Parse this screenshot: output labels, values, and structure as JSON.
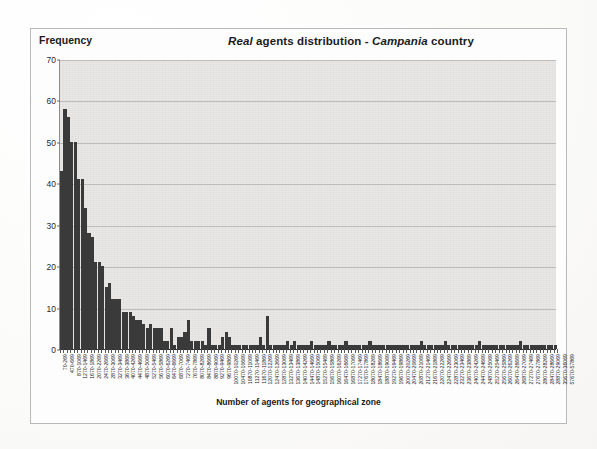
{
  "figure": {
    "title_parts": [
      {
        "text": "Real ",
        "italic": true
      },
      {
        "text": "agents distribution - ",
        "italic": false
      },
      {
        "text": "Campania",
        "italic": true
      },
      {
        "text": " country",
        "italic": false
      }
    ],
    "title_plain": "Real agents distribution - Campania country",
    "ylabel": "Frequency",
    "xlabel": "Number of agents for geographical zone"
  },
  "chart_data": {
    "type": "bar",
    "title": "Real agents distribution - Campania country",
    "xlabel": "Number of agents for geographical zone",
    "ylabel": "Frequency",
    "ylim": [
      0,
      70
    ],
    "ytick_values": [
      0,
      10,
      20,
      30,
      40,
      50,
      60,
      70
    ],
    "grid": true,
    "legend": "none",
    "bin_width": 200,
    "bar_color": "#3a3a3a",
    "plot_background": "#e9e8e6",
    "label_every_n_bins": 2,
    "categories": [
      "70-269",
      "270-469",
      "470-669",
      "670-869",
      "870-1069",
      "1070-1269",
      "1270-1469",
      "1470-1669",
      "1670-1869",
      "1870-2069",
      "2070-2269",
      "2270-2469",
      "2470-2669",
      "2670-2869",
      "2870-3069",
      "3070-3269",
      "3270-3469",
      "3470-3669",
      "3670-3869",
      "3870-4069",
      "4070-4269",
      "4270-4469",
      "4470-4669",
      "4670-4869",
      "4870-5069",
      "5070-5269",
      "5270-5469",
      "5470-5669",
      "5670-5869",
      "5870-6069",
      "6070-6269",
      "6270-6469",
      "6470-6669",
      "6670-6869",
      "6870-7069",
      "7070-7269",
      "7270-7469",
      "7470-7669",
      "7670-7869",
      "7870-8069",
      "8070-8269",
      "8270-8469",
      "8470-8669",
      "8670-8869",
      "8870-9069",
      "9070-9269",
      "9270-9469",
      "9470-9669",
      "9670-9869",
      "9870-10069",
      "10070-10269",
      "10270-10469",
      "10470-10669",
      "10670-10869",
      "10870-11069",
      "11070-11269",
      "11270-11469",
      "11470-11669",
      "11670-11869",
      "11870-12069",
      "12070-12269",
      "12270-12469",
      "12470-12669",
      "12670-12869",
      "12870-13069",
      "13070-13269",
      "13270-13469",
      "13470-13669",
      "13670-13869",
      "13870-14069",
      "14070-14269",
      "14270-14469",
      "14470-14669",
      "14670-14869",
      "14870-15069",
      "15070-15269",
      "15270-15469",
      "15470-15669",
      "15670-15869",
      "15870-16069",
      "16070-16269",
      "16270-16469",
      "16470-16669",
      "16670-16869",
      "16870-17069",
      "17070-17269",
      "17270-17469",
      "17470-17669",
      "17670-17869",
      "17870-18069",
      "18070-18269",
      "18270-18469",
      "18470-18669",
      "18670-18869",
      "18870-19069",
      "19070-19269",
      "19270-19469",
      "19470-19669",
      "19670-19869",
      "19870-20069",
      "20070-20269",
      "20270-20469",
      "20470-20669",
      "20670-20869",
      "20870-21069",
      "21070-21269",
      "21270-21469",
      "21470-21669",
      "21670-21869",
      "21870-22069",
      "22070-22269",
      "22270-22469",
      "22470-22669",
      "22670-22869",
      "22870-23069",
      "23070-23269",
      "23270-23469",
      "23470-23669",
      "23670-23869",
      "23870-24069",
      "24070-24269",
      "24270-24469",
      "24470-24669",
      "24670-24869",
      "24870-25069",
      "25070-25269",
      "25270-25469",
      "25470-25669",
      "25670-25869",
      "25870-26069",
      "26070-26269",
      "26270-26469",
      "26470-26669",
      "26670-26869",
      "26870-27069",
      "27070-27269",
      "27270-27469",
      "27470-27669",
      "27670-27869",
      "27870-28069",
      "28070-28269",
      "28270-28469",
      "28470-28669",
      "28670-28869",
      "28870-29069"
    ],
    "labeled_categories": [
      "70-269",
      "470-669",
      "870-1069",
      "1270-1469",
      "1670-1869",
      "2070-2269",
      "2470-2669",
      "2870-3069",
      "3270-3469",
      "3670-3869",
      "4070-4269",
      "4470-4669",
      "4870-5069",
      "5270-5469",
      "5670-5869",
      "6070-6269",
      "6470-6669",
      "6870-7069",
      "7270-7469",
      "7670-7869",
      "8070-8269",
      "8470-8669",
      "8870-9069",
      "9270-9469",
      "9670-9869",
      "10070-10269",
      "10470-10669",
      "10870-11069",
      "11270-11469",
      "11670-11869",
      "12070-12269",
      "12470-12669",
      "12870-13069",
      "13270-13469",
      "13670-13869",
      "14070-14269",
      "14470-14669",
      "14870-15069",
      "15270-15469",
      "15670-15869",
      "16070-16269",
      "16470-16669",
      "16870-17069",
      "17270-17469",
      "17670-17869",
      "18070-18269",
      "18470-18669",
      "18870-19069",
      "19270-19469",
      "19670-19869",
      "20070-20269",
      "20470-20669",
      "20870-21069",
      "21270-21469",
      "21670-21869",
      "22070-22269",
      "22470-22669",
      "22870-23069",
      "23270-23469",
      "23670-23869",
      "24070-24269",
      "24470-24669",
      "24870-25069",
      "25270-25469",
      "25670-25869",
      "26070-26269",
      "26470-26669",
      "26870-27069",
      "27270-27469",
      "27670-27869",
      "28070-28269",
      "28470-28669",
      "28870-29069",
      "35670-36069",
      "57670-57869"
    ],
    "values": [
      43,
      58,
      56,
      50,
      50,
      41,
      41,
      34,
      28,
      27,
      21,
      21,
      20,
      15,
      16,
      12,
      12,
      12,
      9,
      9,
      9,
      8,
      7,
      7,
      6,
      5,
      6,
      5,
      5,
      5,
      2,
      2,
      5,
      1,
      3,
      3,
      4,
      7,
      2,
      2,
      2,
      2,
      1,
      5,
      1,
      1,
      1,
      3,
      4,
      3,
      1,
      1,
      1,
      1,
      1,
      1,
      1,
      1,
      3,
      1,
      8,
      1,
      1,
      1,
      1,
      1,
      2,
      1,
      2,
      1,
      1,
      1,
      1,
      2,
      1,
      1,
      1,
      1,
      2,
      1,
      1,
      1,
      1,
      2,
      1,
      1,
      1,
      1,
      1,
      1,
      2,
      1,
      1,
      1,
      1,
      1,
      1,
      1,
      1,
      1,
      1,
      1,
      1,
      1,
      1,
      2,
      1,
      1,
      1,
      1,
      1,
      1,
      2,
      1,
      1,
      1,
      1,
      1,
      1,
      1,
      1,
      1,
      2,
      1,
      1,
      1,
      1,
      1,
      1,
      1,
      1,
      1,
      1,
      1,
      2,
      1,
      1,
      1,
      1,
      1,
      1,
      1,
      1,
      1,
      1
    ]
  }
}
